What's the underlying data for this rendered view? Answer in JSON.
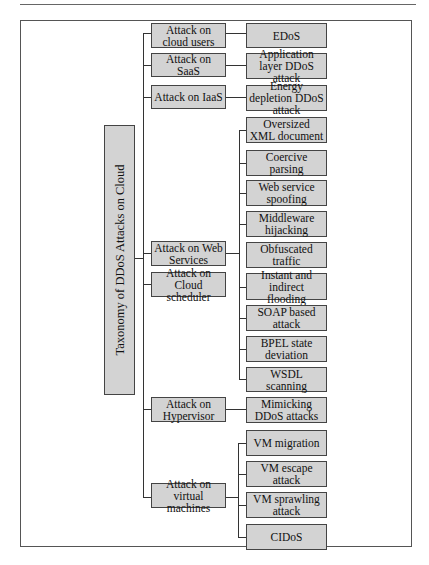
{
  "diagram": {
    "root": "Taxonomy of DDoS Attacks on Cloud",
    "categories": [
      {
        "label": "Attack on cloud users",
        "children": [
          "EDoS"
        ]
      },
      {
        "label": "Attack on SaaS",
        "children": [
          "Application layer DDoS attack"
        ]
      },
      {
        "label": "Attack on IaaS",
        "children": [
          "Energy depletion DDoS attack"
        ]
      },
      {
        "label": "Attack on Web Services",
        "children": [
          "Oversized XML document",
          "Coercive parsing",
          "Web service spoofing",
          "Middleware hijacking",
          "Obfuscated traffic",
          "Instant and indirect flooding",
          "SOAP based attack",
          "BPEL state deviation",
          "WSDL scanning"
        ]
      },
      {
        "label": "Attack on Cloud scheduler",
        "children": []
      },
      {
        "label": "Attack on Hypervisor",
        "children": [
          "Mimicking DDoS attacks"
        ]
      },
      {
        "label": "Attack on virtual machines",
        "children": [
          "VM migration",
          "VM escape attack",
          "VM sprawling attack",
          "CIDoS"
        ]
      }
    ]
  }
}
